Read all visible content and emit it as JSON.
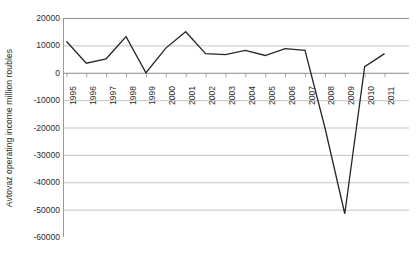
{
  "chart_data": {
    "type": "line",
    "title": "",
    "xlabel": "",
    "ylabel": "Avtovaz operating income million roubles",
    "categories": [
      "1995",
      "1996",
      "1997",
      "1998",
      "1999",
      "2000",
      "2001",
      "2002",
      "2003",
      "2004",
      "2005",
      "2006",
      "2007",
      "2008",
      "2009",
      "2010",
      "2011"
    ],
    "values": [
      11500,
      3500,
      5100,
      13200,
      0,
      9000,
      15000,
      7000,
      6600,
      8200,
      6300,
      8800,
      8200,
      -20000,
      -51500,
      2200,
      7000
    ],
    "series": [
      {
        "name": "Avtovaz operating income",
        "values": [
          11500,
          3500,
          5100,
          13200,
          0,
          9000,
          15000,
          7000,
          6600,
          8200,
          6300,
          8800,
          8200,
          -20000,
          -51500,
          2200,
          7000
        ]
      }
    ],
    "ylim": [
      -60000,
      20000
    ],
    "ytick_labels": [
      "20000",
      "10000",
      "0",
      "-10000",
      "-20000",
      "-30000",
      "-40000",
      "-50000",
      "-60000"
    ],
    "ytick_values": [
      20000,
      10000,
      0,
      -10000,
      -20000,
      -30000,
      -40000,
      -50000,
      -60000
    ],
    "grid": true,
    "legend": "none",
    "line_color": "#262626",
    "grid_color": "#b5b5b5",
    "axis_color": "#8c8c8c",
    "background_color": "#ffffff"
  }
}
